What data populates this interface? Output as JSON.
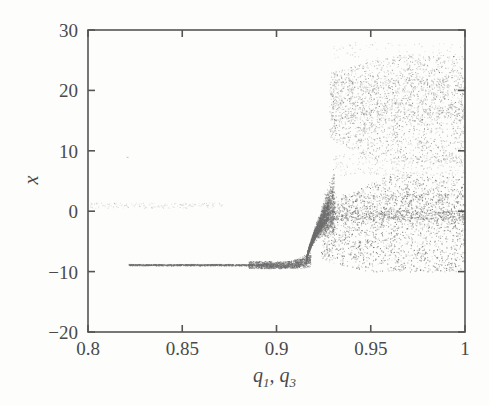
{
  "chart_data": {
    "type": "scatter",
    "title": "",
    "subtitle": "",
    "xlabel": "q_1, q_3",
    "xlabel_parts": {
      "sym1": "q",
      "sub1": "1",
      "comma": ",",
      "sym2": "q",
      "sub2": "3"
    },
    "ylabel": "x",
    "xlim": [
      0.8,
      1
    ],
    "ylim": [
      -20,
      30
    ],
    "xticks": [
      0.8,
      0.85,
      0.9,
      0.95,
      1
    ],
    "xtick_labels": [
      "0.8",
      "0.85",
      "0.9",
      "0.95",
      "1"
    ],
    "yticks": [
      -20,
      -10,
      0,
      10,
      20,
      30
    ],
    "ytick_labels": [
      "-20",
      "-10",
      "0",
      "10",
      "20",
      "30"
    ],
    "grid": false,
    "legend": null,
    "point_color": "#6f6f6f",
    "point_size": 1,
    "axis_color": "#555555",
    "background": "#fdfdfc",
    "series": [
      {
        "name": "stable-branch",
        "comment": "flat fixed point branch, x ~ -8.8, q from 0.8215 to 0.918",
        "x_start": 0.8215,
        "x_end": 0.918,
        "y_level": -8.85
      },
      {
        "name": "faint-upper-branch",
        "comment": "faint short dashed segment near x = 1, q from 0.801 to 0.871",
        "x_start": 0.801,
        "x_end": 0.871,
        "y_level": 1.0
      },
      {
        "name": "transition-curve",
        "comment": "rapid rise of branch from x = -8.8 to about x = 0 between q = 0.9155 and q = 0.9305",
        "x_start": 0.9155,
        "x_end": 0.9305,
        "y_start": -8.8,
        "y_end": 1.5
      },
      {
        "name": "chaotic-lower-band",
        "comment": "dense chaotic scatter, q from 0.9235 to 1, x from -10 to 6",
        "x_start": 0.9235,
        "x_end": 1.0,
        "y_min": -10,
        "y_max": 6
      },
      {
        "name": "chaotic-upper-band",
        "comment": "chaotic scatter band, q from 0.928 to 1, x from 8 to 26",
        "x_start": 0.928,
        "x_end": 1.0,
        "y_min": 8,
        "y_max": 26
      },
      {
        "name": "isolated-point",
        "comment": "single stray point near q = 0.8205, x = 9",
        "x": 0.8205,
        "y": 9
      }
    ],
    "annotations": []
  },
  "plot_geometry": {
    "left": 88,
    "right": 465,
    "top": 30,
    "bottom": 332
  }
}
